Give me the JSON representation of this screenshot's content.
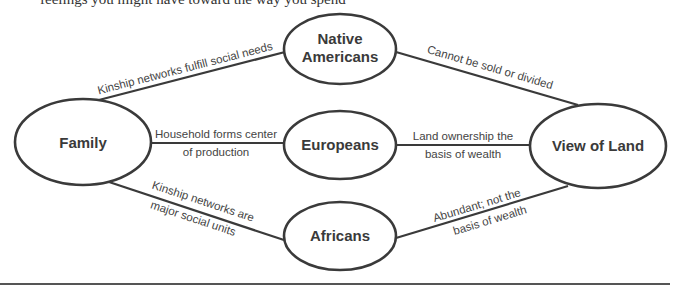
{
  "page": {
    "top_text": "feelings you might have toward the way you spend"
  },
  "diagram": {
    "nodes": {
      "family": "Family",
      "native_americans_line1": "Native",
      "native_americans_line2": "Americans",
      "europeans": "Europeans",
      "africans": "Africans",
      "view_of_land": "View of Land"
    },
    "edges": {
      "family_native": "Kinship networks fulfill social needs",
      "family_europeans_line1": "Household forms center",
      "family_europeans_line2": "of production",
      "family_africans_line1": "Kinship networks are",
      "family_africans_line2": "major social units",
      "native_land": "Cannot be sold or divided",
      "europeans_land_line1": "Land ownership the",
      "europeans_land_line2": "basis of wealth",
      "africans_land_line1": "Abundant; not the",
      "africans_land_line2": "basis of wealth"
    },
    "colors": {
      "stroke": "#3a3a3a",
      "text": "#3a3a3a",
      "background": "#ffffff"
    }
  }
}
